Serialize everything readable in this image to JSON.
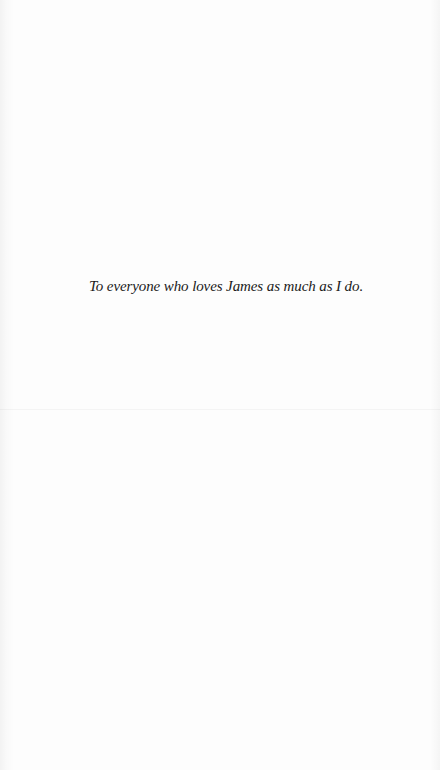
{
  "page": {
    "type": "dedication",
    "background_color": "#fdfdfd",
    "text_color": "#1a1a1a"
  },
  "dedication": {
    "text": "To everyone who loves James as much as I do."
  }
}
